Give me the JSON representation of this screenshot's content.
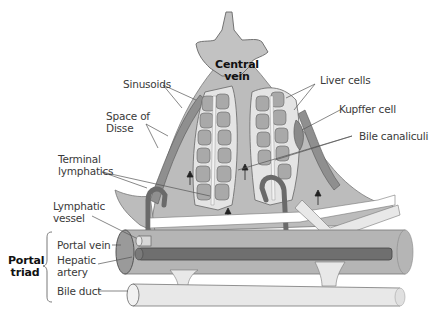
{
  "diagram": {
    "colors": {
      "lobule_fill": "#bcbcbc",
      "central_vein_fill": "#c2c2c2",
      "sinusoid_fill": "#8f8f8f",
      "liver_cell_fill": "#a9a9a9",
      "cord_outline_fill": "#e4e4e4",
      "portal_vein_fill": "#b5b5b5",
      "hepatic_artery_fill": "#6f6f6f",
      "bile_duct_fill": "#e8e8e8",
      "lymphatic_fill": "#7a7a7a",
      "line": "#555555"
    },
    "labels": {
      "central_vein_line1": "Central",
      "central_vein_line2": "vein",
      "sinusoids": "Sinusoids",
      "space_of_disse_line1": "Space of",
      "space_of_disse_line2": "Disse",
      "terminal_lymphatics_line1": "Terminal",
      "terminal_lymphatics_line2": "lymphatics",
      "lymphatic_vessel_line1": "Lymphatic",
      "lymphatic_vessel_line2": "vessel",
      "liver_cells": "Liver cells",
      "kupffer_cell": "Kupffer cell",
      "bile_canaliculi": "Bile canaliculi",
      "portal_triad_line1": "Portal",
      "portal_triad_line2": "triad",
      "portal_vein": "Portal vein",
      "hepatic_artery_line1": "Hepatic",
      "hepatic_artery_line2": "artery",
      "bile_duct": "Bile duct"
    }
  }
}
